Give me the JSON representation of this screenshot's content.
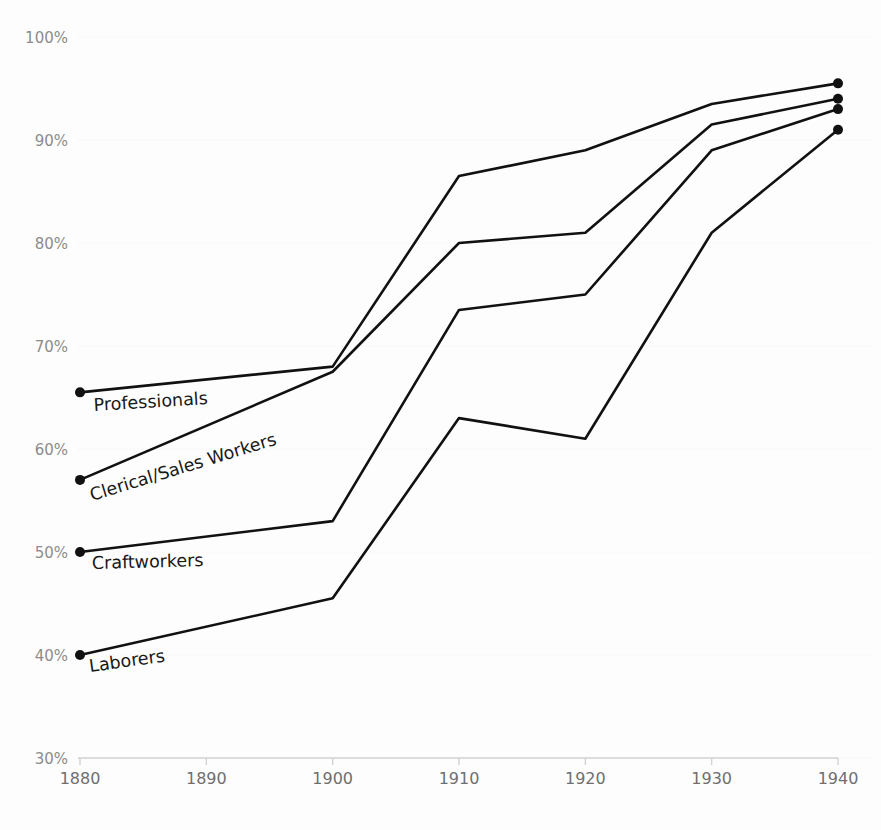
{
  "chart_data": {
    "type": "line",
    "title": "",
    "subtitle": "",
    "xlabel": "",
    "ylabel": "",
    "x": [
      1880,
      1900,
      1910,
      1920,
      1930,
      1940
    ],
    "xlim": [
      1880,
      1940
    ],
    "ylim": [
      30,
      100
    ],
    "grid": true,
    "legend_position": "inline-labels",
    "y_tick_labels": [
      "100%",
      "90%",
      "80%",
      "70%",
      "60%",
      "50%",
      "40%",
      "30%"
    ],
    "y_tick_values": [
      100,
      90,
      80,
      70,
      60,
      50,
      40,
      30
    ],
    "x_tick_labels": [
      "1880",
      "1890",
      "1900",
      "1910",
      "1920",
      "1930",
      "1940"
    ],
    "x_tick_values": [
      1880,
      1890,
      1900,
      1910,
      1920,
      1930,
      1940
    ],
    "series": [
      {
        "name": "Professionals",
        "label": "Professionals",
        "color": "#111111",
        "x": [
          1880,
          1900,
          1910,
          1920,
          1930,
          1940
        ],
        "values": [
          65.5,
          68.0,
          86.5,
          89.0,
          93.5,
          95.5
        ]
      },
      {
        "name": "Clerical/Sales Workers",
        "label": "Clerical/Sales Workers",
        "color": "#111111",
        "x": [
          1880,
          1900,
          1910,
          1920,
          1930,
          1940
        ],
        "values": [
          57.0,
          67.5,
          80.0,
          81.0,
          91.5,
          94.0
        ]
      },
      {
        "name": "Craftworkers",
        "label": "Craftworkers",
        "color": "#111111",
        "x": [
          1880,
          1900,
          1910,
          1920,
          1930,
          1940
        ],
        "values": [
          50.0,
          53.0,
          73.5,
          75.0,
          89.0,
          93.0
        ]
      },
      {
        "name": "Laborers",
        "label": "Laborers",
        "color": "#111111",
        "x": [
          1880,
          1900,
          1910,
          1920,
          1930,
          1940
        ],
        "values": [
          40.0,
          45.5,
          63.0,
          61.0,
          81.0,
          91.0
        ]
      }
    ],
    "series_label_placement": [
      {
        "name": "Professionals",
        "x": 94,
        "y": 411,
        "rotate": -3.5
      },
      {
        "name": "Clerical/Sales Workers",
        "x": 92,
        "y": 501,
        "rotate": -17
      },
      {
        "name": "Craftworkers",
        "x": 92,
        "y": 569,
        "rotate": -1.5
      },
      {
        "name": "Laborers",
        "x": 90,
        "y": 672,
        "rotate": -8
      }
    ],
    "colors": {
      "line": "#111111",
      "gridline": "#ececec",
      "axis": "#d2d2d2",
      "y_tick_text": "#8c8c8c",
      "x_tick_text": "#6f6f6f",
      "label_text": "#191919",
      "background": "#fdfdfd"
    }
  }
}
